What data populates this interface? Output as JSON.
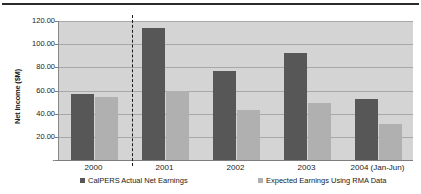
{
  "chart_data": {
    "type": "bar",
    "title": "",
    "subtitle": "",
    "xlabel": "",
    "ylabel": "Net Income ($M)",
    "categories": [
      "2000",
      "2001",
      "2002",
      "2003",
      "2004 (Jan-Jun)"
    ],
    "series": [
      {
        "name": "CalPERS Actual Net Earnings",
        "color": "#575757",
        "values": [
          57.0,
          114.0,
          77.0,
          92.0,
          53.0
        ]
      },
      {
        "name": "Expected Earnings Using RMA Data",
        "color": "#b0b0b0",
        "values": [
          54.0,
          60.0,
          43.0,
          49.0,
          31.0
        ]
      }
    ],
    "ylim": [
      0,
      120
    ],
    "ytick_values": [
      0,
      20,
      40,
      60,
      80,
      100,
      120
    ],
    "ytick_labels": [
      "-",
      "20.00",
      "40.00",
      "60.00",
      "80.00",
      "100.00",
      "120.00"
    ],
    "grid": true,
    "legend_position": "bottom",
    "annotations": [
      {
        "type": "vertical-dashed-line",
        "name": "forecast-divider",
        "after_category": "2000"
      }
    ],
    "plot_background": "#d4d4d4"
  },
  "legend": {
    "entries": [
      {
        "label": "CalPERS Actual Net Earnings",
        "marker": "square-dark"
      },
      {
        "label": "Expected Earnings Using RMA Data",
        "marker": "square-light"
      }
    ]
  }
}
